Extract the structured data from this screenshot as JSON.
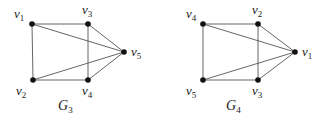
{
  "graphs": [
    {
      "name": "G3",
      "label": {
        "base": "G",
        "sub": "3",
        "x": 58,
        "y": 110
      },
      "nodes": [
        {
          "id": "v1",
          "base": "v",
          "sub": "1",
          "x": 32,
          "y": 24,
          "lx": 14,
          "ly": 18
        },
        {
          "id": "v3",
          "base": "v",
          "sub": "3",
          "x": 88,
          "y": 24,
          "lx": 82,
          "ly": 14
        },
        {
          "id": "v5",
          "base": "v",
          "sub": "5",
          "x": 124,
          "y": 52,
          "lx": 131,
          "ly": 56
        },
        {
          "id": "v2",
          "base": "v",
          "sub": "2",
          "x": 33,
          "y": 80,
          "lx": 16,
          "ly": 95
        },
        {
          "id": "v4",
          "base": "v",
          "sub": "4",
          "x": 88,
          "y": 80,
          "lx": 82,
          "ly": 95
        }
      ],
      "edges": [
        [
          "v1",
          "v3"
        ],
        [
          "v1",
          "v2"
        ],
        [
          "v1",
          "v5"
        ],
        [
          "v3",
          "v4"
        ],
        [
          "v3",
          "v5"
        ],
        [
          "v2",
          "v4"
        ],
        [
          "v2",
          "v5"
        ],
        [
          "v4",
          "v5"
        ]
      ]
    },
    {
      "name": "G4",
      "label": {
        "base": "G",
        "sub": "4",
        "x": 226,
        "y": 110
      },
      "nodes": [
        {
          "id": "v4",
          "base": "v",
          "sub": "4",
          "x": 203,
          "y": 24,
          "lx": 186,
          "ly": 18
        },
        {
          "id": "v2",
          "base": "v",
          "sub": "2",
          "x": 258,
          "y": 24,
          "lx": 252,
          "ly": 14
        },
        {
          "id": "v1",
          "base": "v",
          "sub": "1",
          "x": 295,
          "y": 52,
          "lx": 302,
          "ly": 56
        },
        {
          "id": "v5",
          "base": "v",
          "sub": "5",
          "x": 203,
          "y": 80,
          "lx": 186,
          "ly": 95
        },
        {
          "id": "v3",
          "base": "v",
          "sub": "3",
          "x": 258,
          "y": 80,
          "lx": 252,
          "ly": 95
        }
      ],
      "edges": [
        [
          "v4",
          "v2"
        ],
        [
          "v4",
          "v5"
        ],
        [
          "v4",
          "v1"
        ],
        [
          "v2",
          "v3"
        ],
        [
          "v2",
          "v1"
        ],
        [
          "v5",
          "v3"
        ],
        [
          "v5",
          "v1"
        ],
        [
          "v3",
          "v1"
        ]
      ]
    }
  ]
}
